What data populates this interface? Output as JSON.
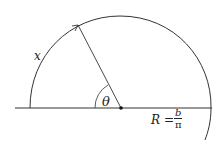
{
  "diagram": {
    "labels": {
      "arc_label": "x",
      "angle_label": "θ",
      "radius_var": "R",
      "equals": "=",
      "numerator": "b",
      "denominator": "π"
    },
    "elements": [
      "baseline",
      "outer-arc",
      "radius-line-with-arrow",
      "angle-arc",
      "center-dot"
    ],
    "colors": {
      "stroke": "#333333",
      "text": "#222222"
    }
  }
}
